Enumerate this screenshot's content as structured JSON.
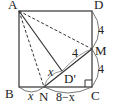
{
  "diagram": {
    "type": "geometry-square-fold",
    "vertices": {
      "A": "A",
      "B": "B",
      "C": "C",
      "D": "D",
      "M": "M",
      "N": "N",
      "Dprime": "D'"
    },
    "measures": {
      "DM": "4",
      "MC": "4",
      "MDprime": "4",
      "NDprime": "x",
      "BN": "x",
      "NC": "8−x"
    },
    "colors": {
      "line": "#333333",
      "background": "#ffffff"
    }
  }
}
